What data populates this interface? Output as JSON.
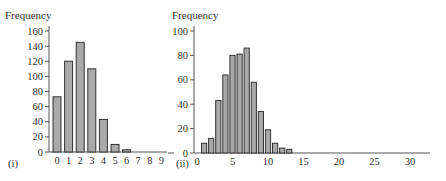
{
  "chart_data": [
    {
      "type": "bar",
      "panel_label": "(i)",
      "title": "",
      "ylabel": "Frequency",
      "xlabel": "",
      "categories": [
        "0",
        "1",
        "2",
        "3",
        "4",
        "5",
        "6",
        "7",
        "8",
        "9"
      ],
      "values": [
        73,
        120,
        145,
        110,
        43,
        10,
        3,
        0,
        0,
        0
      ],
      "ylim": [
        0,
        160
      ],
      "yticks": [
        0,
        20,
        40,
        60,
        80,
        100,
        120,
        140,
        160
      ],
      "xticks": [
        "0",
        "1",
        "2",
        "3",
        "4",
        "5",
        "6",
        "7",
        "8",
        "9"
      ],
      "grid": false,
      "legend": null
    },
    {
      "type": "bar",
      "panel_label": "(ii)",
      "title": "",
      "ylabel": "Frequency",
      "xlabel": "",
      "x": [
        1,
        2,
        3,
        4,
        5,
        6,
        7,
        8,
        9,
        10,
        11,
        12,
        13
      ],
      "values": [
        8,
        12,
        43,
        64,
        80,
        81,
        86,
        58,
        34,
        19,
        8,
        4,
        3
      ],
      "ylim": [
        0,
        100
      ],
      "xlim": [
        0,
        33
      ],
      "yticks": [
        0,
        20,
        40,
        60,
        80,
        100
      ],
      "xticks": [
        0,
        5,
        10,
        15,
        20,
        25,
        30
      ],
      "grid": false,
      "legend": null
    }
  ],
  "colors": {
    "bar_fill": "#a9a9a9",
    "bar_edge": "#333333",
    "axis": "#555555"
  }
}
